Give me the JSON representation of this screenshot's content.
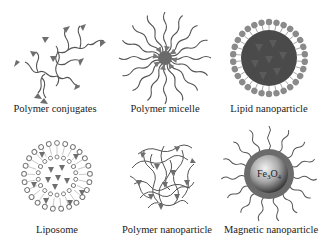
{
  "figure": {
    "panels": [
      {
        "id": "polymer-conjugates",
        "label": "Polymer conjugates"
      },
      {
        "id": "polymer-micelle",
        "label": "Polymer micelle"
      },
      {
        "id": "lipid-nanoparticle",
        "label": "Lipid nanoparticle"
      },
      {
        "id": "liposome",
        "label": "Liposome"
      },
      {
        "id": "polymer-nanoparticle",
        "label": "Polymer nanoparticle"
      },
      {
        "id": "magnetic-nanoparticle",
        "label": "Magnetic nanoparticle",
        "core_label": "Fe3O4"
      }
    ],
    "colors": {
      "stroke": "#555555",
      "drug": "#6e6e6e",
      "lipid_head": "#8a8a8a",
      "core_dark": "#4a4a4a",
      "shell": "#6b6b6b",
      "text": "#222222"
    }
  }
}
